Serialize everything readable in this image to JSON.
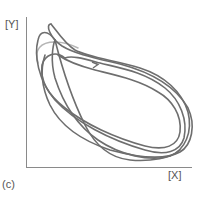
{
  "figure": {
    "panel_label": "(c)",
    "x_axis_label": "[X]",
    "y_axis_label": "[Y]",
    "trajectory_color": "#6e6e6e",
    "axis_color": "#888888"
  }
}
